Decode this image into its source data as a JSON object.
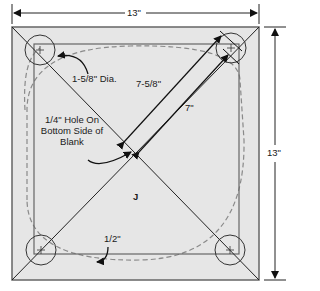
{
  "diagram": {
    "type": "woodworking-template",
    "part_letter": "J",
    "dimensions": {
      "width": "13\"",
      "height": "13\""
    },
    "annotations": {
      "hole_diameter": "1-5/8\" Dia.",
      "diagonal_outer": "7-5/8\"",
      "diagonal_inner": "7\"",
      "center_hole_line1": "1/4\" Hole On",
      "center_hole_line2": "Bottom Side of",
      "center_hole_line3": "Blank",
      "edge_inset": "1/2\""
    },
    "colors": {
      "blank_fill": "#e6e6e6",
      "outline": "#555555",
      "dashed": "#8a8a8a",
      "text": "#1a1a1a"
    }
  }
}
